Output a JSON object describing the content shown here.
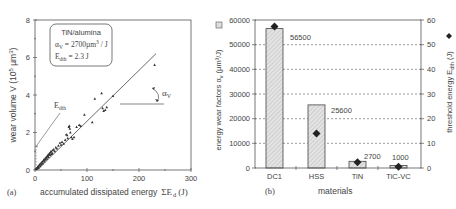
{
  "chart_data": [
    {
      "type": "scatter",
      "panel_label": "(a)",
      "title": "",
      "xlabel": "accumulated dissipated energy ΣE_d (J)",
      "ylabel": "wear volume V (10^5 µm^3)",
      "xlim": [
        0,
        300
      ],
      "ylim": [
        0,
        8
      ],
      "xticks": [
        "0",
        "100",
        "200",
        "300"
      ],
      "yticks": [
        "0",
        "2",
        "4",
        "6",
        "8"
      ],
      "grid": false,
      "legend_box": {
        "line1": "TiN/alumina",
        "line2": "αV = 2700µm³/J",
        "line3": "Edth = 2.3 J"
      },
      "annotations": [
        "E_dth",
        "α_V"
      ],
      "fit_line": {
        "x": [
          4.3,
          233
        ],
        "y": [
          0,
          6.2
        ]
      },
      "points": [
        [
          2,
          0.05
        ],
        [
          3,
          0.1
        ],
        [
          4,
          0.08
        ],
        [
          5,
          0.15
        ],
        [
          6,
          0.2
        ],
        [
          7,
          0.12
        ],
        [
          8,
          0.25
        ],
        [
          9,
          0.3
        ],
        [
          10,
          0.2
        ],
        [
          11,
          0.35
        ],
        [
          12,
          0.3
        ],
        [
          13,
          0.4
        ],
        [
          14,
          0.45
        ],
        [
          15,
          0.35
        ],
        [
          16,
          0.5
        ],
        [
          17,
          0.55
        ],
        [
          18,
          0.45
        ],
        [
          19,
          0.6
        ],
        [
          20,
          0.55
        ],
        [
          21,
          0.65
        ],
        [
          22,
          0.7
        ],
        [
          23,
          0.6
        ],
        [
          24,
          0.75
        ],
        [
          25,
          0.8
        ],
        [
          26,
          0.7
        ],
        [
          27,
          0.85
        ],
        [
          28,
          0.9
        ],
        [
          29,
          0.8
        ],
        [
          30,
          0.95
        ],
        [
          31,
          1.0
        ],
        [
          32,
          0.85
        ],
        [
          33,
          0.9
        ],
        [
          34,
          1.05
        ],
        [
          36,
          1.1
        ],
        [
          38,
          1.0
        ],
        [
          40,
          1.2
        ],
        [
          42,
          1.15
        ],
        [
          45,
          1.3
        ],
        [
          48,
          1.45
        ],
        [
          50,
          1.35
        ],
        [
          52,
          1.5
        ],
        [
          55,
          1.4
        ],
        [
          58,
          1.6
        ],
        [
          60,
          1.9
        ],
        [
          62,
          1.85
        ],
        [
          63,
          1.7
        ],
        [
          65,
          2.3
        ],
        [
          66,
          2.35
        ],
        [
          67,
          2.2
        ],
        [
          68,
          2.0
        ],
        [
          70,
          1.75
        ],
        [
          72,
          1.65
        ],
        [
          75,
          1.75
        ],
        [
          80,
          2.3
        ],
        [
          85,
          2.4
        ],
        [
          88,
          2.35
        ],
        [
          95,
          2.95
        ],
        [
          110,
          2.55
        ],
        [
          115,
          3.8
        ],
        [
          128,
          4.1
        ],
        [
          130,
          3.3
        ],
        [
          132,
          3.15
        ],
        [
          135,
          3.2
        ],
        [
          138,
          3.35
        ],
        [
          150,
          3.95
        ],
        [
          230,
          5.6
        ]
      ]
    },
    {
      "type": "bar",
      "panel_label": "(b)",
      "title": "",
      "xlabel": "materials",
      "ylabel": "energy wear factors α_v (µm³/J)",
      "ylabel_right": "threshold energy E_dth (J)",
      "categories": [
        "DC1",
        "HSS",
        "TiN",
        "TiC-VC"
      ],
      "series": [
        {
          "name": "energy wear factors α_v",
          "axis": "left",
          "marker": "hatched-bar",
          "values": [
            56500,
            25600,
            2700,
            1000
          ]
        },
        {
          "name": "threshold energy E_dth",
          "axis": "right",
          "marker": "diamond",
          "values": [
            57,
            14,
            2.3,
            0.5
          ]
        }
      ],
      "bar_labels": [
        "56500",
        "25600",
        "2700",
        "1000"
      ],
      "ylim": [
        0,
        60000
      ],
      "ylim_right": [
        0,
        60
      ],
      "yticks": [
        "0",
        "10000",
        "20000",
        "30000",
        "40000",
        "50000",
        "60000"
      ],
      "yticks_right": [
        "0",
        "10",
        "20",
        "30",
        "40",
        "50",
        "60"
      ],
      "grid": "dashed horizontal",
      "legend_position": "axis labels"
    }
  ],
  "left": {
    "panel": "(a)",
    "xlabel_main": "accumulated dissipated energy",
    "xlabel_sym": "ΣE",
    "xlabel_sub": "d",
    "xlabel_unit": "(J)",
    "ylabel": "wear volume V (10",
    "ylabel_exp": "5",
    "ylabel_tail": " µm",
    "ylabel_exp2": "3",
    "ylabel_end": ")",
    "box1": "TiN/alumina",
    "box2a": "α",
    "box2sub": "V",
    "box2b": " = 2700µm",
    "box2sup": "3",
    "box2c": " / J",
    "box3a": "E",
    "box3sub": "dth",
    "box3b": " = 2.3  J",
    "edth_a": "E",
    "edth_sub": "dth",
    "alpha_a": "α",
    "alpha_sub": "V",
    "xt0": "0",
    "xt1": "100",
    "xt2": "200",
    "xt3": "300",
    "yt0": "0",
    "yt1": "2",
    "yt2": "4",
    "yt3": "6",
    "yt4": "8"
  },
  "right": {
    "panel": "(b)",
    "xlabel": "materials",
    "ylabel_left": "energy wear factors α",
    "ylabel_left_sub": "v",
    "ylabel_left_unit": " (µm³/J)",
    "ylabel_right": "threshold energy E",
    "ylabel_right_sub": "dth",
    "ylabel_right_unit": " (J)",
    "cat0": "DC1",
    "cat1": "HSS",
    "cat2": "TiN",
    "cat3": "TiC-VC",
    "lab0": "56500",
    "lab1": "25600",
    "lab2": "2700",
    "lab3": "1000",
    "yl0": "0",
    "yl1": "10000",
    "yl2": "20000",
    "yl3": "30000",
    "yl4": "40000",
    "yl5": "50000",
    "yl6": "60000",
    "yr0": "0",
    "yr1": "10",
    "yr2": "20",
    "yr3": "30",
    "yr4": "40",
    "yr5": "50",
    "yr6": "60"
  }
}
